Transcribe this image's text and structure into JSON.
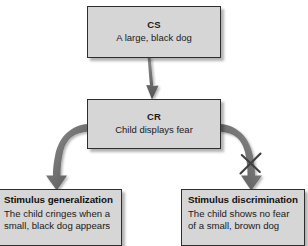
{
  "diagram": {
    "type": "flowchart",
    "nodes": [
      {
        "id": "cs",
        "title": "CS",
        "description": "A large, black dog"
      },
      {
        "id": "cr",
        "title": "CR",
        "description": "Child displays fear"
      },
      {
        "id": "generalization",
        "title": "Stimulus generalization",
        "description": "The child cringes when a\nsmall, black dog appears"
      },
      {
        "id": "discrimination",
        "title": "Stimulus discrimination",
        "description": "The child shows no fear\nof a small, brown dog"
      }
    ],
    "connectors": [
      {
        "id": "cs-to-cr",
        "from": "cs",
        "to": "cr",
        "style": "straight-arrow",
        "blocked": false
      },
      {
        "id": "cr-to-generalization",
        "from": "cr",
        "to": "generalization",
        "style": "curved-arrow",
        "blocked": false
      },
      {
        "id": "cr-to-discrimination",
        "from": "cr",
        "to": "discrimination",
        "style": "curved-arrow",
        "blocked": true,
        "block_mark": "x-slash"
      }
    ]
  },
  "colors": {
    "box_fill": "#d6d6d6",
    "box_border": "#2e2e2e",
    "arrow_fill": "#6e6e6e",
    "arrow_dark": "#4a4a4a",
    "text": "#1a1a1a",
    "background": "#ffffff"
  }
}
